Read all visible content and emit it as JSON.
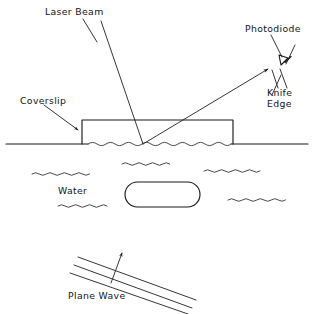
{
  "figure": {
    "background_color": "#ffffff",
    "line_color": "#1a1a1a",
    "width": 314,
    "height": 314
  },
  "labels": {
    "laser_beam": "Laser Beam",
    "photodiode": "Photodiode",
    "knife_edge_line1": "Knife",
    "knife_edge_line2": "Edge",
    "coverslip": "Coverslip",
    "water": "Water",
    "plane_wave": "Plane  Wave"
  },
  "elements": {
    "coverslip_box": {
      "name": "coverslip-rectangle",
      "x": 82,
      "y": 120,
      "width": 151,
      "height": 24
    },
    "water_surface": {
      "name": "water-surface-line",
      "y": 144,
      "x_start": 6,
      "x_end": 308,
      "ripple_x_start": 88,
      "ripple_x_end": 231
    },
    "incident_beam": {
      "name": "incident-laser-beam",
      "from": [
        102,
        22
      ],
      "to": [
        143,
        144
      ]
    },
    "reflected_beam": {
      "name": "reflected-laser-beam",
      "from": [
        143,
        144
      ],
      "to": [
        270,
        68
      ],
      "arrow": "at-end"
    },
    "laser_beam_leader": {
      "from": [
        83,
        19
      ],
      "to": [
        95,
        39
      ]
    },
    "photodiode_symbol": {
      "name": "photodiode-diode-symbol",
      "center": [
        283,
        60
      ]
    },
    "photodiode_leader": {
      "from": [
        272,
        34
      ],
      "to": [
        281,
        56
      ]
    },
    "photodiode_axis": {
      "from": [
        296,
        44
      ],
      "to": [
        272,
        96
      ]
    },
    "knife_edge_leaders": [
      {
        "from": [
          279,
          86
        ],
        "to": [
          273,
          69
        ]
      },
      {
        "from": [
          287,
          86
        ],
        "to": [
          281,
          68
        ]
      }
    ],
    "coverslip_leader": {
      "from": [
        43,
        104
      ],
      "to": [
        79,
        130
      ],
      "arrow": "at-end"
    },
    "bubble": {
      "name": "water-bubble-oval",
      "x": 125,
      "y": 182,
      "width": 75,
      "height": 25,
      "radius": 12.5
    },
    "squiggles": [
      {
        "x": 32,
        "y": 174,
        "length": 58
      },
      {
        "x": 122,
        "y": 165,
        "length": 52
      },
      {
        "x": 206,
        "y": 172,
        "length": 52
      },
      {
        "x": 58,
        "y": 205,
        "length": 50
      },
      {
        "x": 228,
        "y": 200,
        "length": 58
      }
    ],
    "plane_wave_lines": [
      {
        "from": [
          78,
          258
        ],
        "to": [
          195,
          300
        ]
      },
      {
        "from": [
          74,
          266
        ],
        "to": [
          191,
          308
        ]
      },
      {
        "from": [
          70,
          274
        ],
        "to": [
          187,
          314
        ]
      }
    ],
    "plane_wave_arrow": {
      "name": "plane-wave-propagation-arrow",
      "from": [
        112,
        282
      ],
      "to": [
        123,
        252
      ]
    }
  },
  "label_positions": {
    "laser_beam": [
      45,
      14
    ],
    "photodiode": [
      246,
      31
    ],
    "knife_line1": [
      268,
      94
    ],
    "knife_line2": [
      268,
      105
    ],
    "coverslip": [
      20,
      103
    ],
    "water": [
      58,
      191
    ],
    "plane_wave": [
      68,
      297
    ]
  }
}
